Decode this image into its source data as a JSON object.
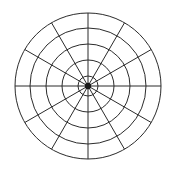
{
  "figure": {
    "title": "",
    "background_color": "#ffffff",
    "width": 176,
    "height": 171
  },
  "chart_data": {
    "type": "line",
    "subtype": "polar-grid",
    "title": "",
    "subtitle": "",
    "xlabel": "",
    "ylabel": "",
    "grid": true,
    "legend": false,
    "legend_position": "none",
    "annotations": [],
    "series": [],
    "categories": [],
    "values": [],
    "tick_labels": {
      "radial": [],
      "angular": []
    },
    "polar": {
      "center_x": 88,
      "center_y": 86,
      "outer_radius": 73,
      "circle_count": 5,
      "circle_radii": [
        10,
        26,
        42,
        58,
        73
      ],
      "spoke_count": 12,
      "spoke_angle_step_degrees": 30,
      "spoke_angles_degrees": [
        0,
        30,
        60,
        90,
        120,
        150,
        180,
        210,
        240,
        270,
        300,
        330
      ],
      "center_hub_radius": 3.2,
      "rlim": [
        0,
        73
      ],
      "theta_direction": "counterclockwise",
      "theta_zero_location": "E"
    },
    "style": {
      "line_color": "#2b2b2b",
      "line_width": 1,
      "hub_color": "#1a1a1a",
      "background_color": "#ffffff"
    }
  }
}
